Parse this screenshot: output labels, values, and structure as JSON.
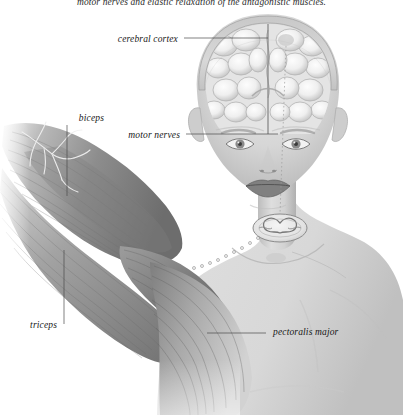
{
  "figure": {
    "caption_top": "motor nerves and elastic relaxation of the antagonistic muscles.",
    "background_color": "#ffffff",
    "skin_tone": "#d4d4d4",
    "muscle_tone": "#8f8f8f",
    "outline_color": "#6e6e6e",
    "label_color": "#171717",
    "leader_color": "#4a4a4a"
  },
  "labels": [
    {
      "id": "cerebral-cortex",
      "text": "cerebral cortex",
      "x": 178,
      "y": 41,
      "align": "right",
      "leader": {
        "x1": 184,
        "y1": 38,
        "x2": 268,
        "y2": 38
      }
    },
    {
      "id": "biceps",
      "text": "biceps",
      "x": 104,
      "y": 120,
      "align": "right",
      "leader": {
        "x1": 67,
        "y1": 125,
        "x2": 67,
        "y2": 196
      }
    },
    {
      "id": "motor-nerves",
      "text": "motor nerves",
      "x": 180,
      "y": 137,
      "align": "right",
      "leader": {
        "x1": 186,
        "y1": 134,
        "x2": 278,
        "y2": 134
      }
    },
    {
      "id": "triceps",
      "text": "triceps",
      "x": 57,
      "y": 327,
      "align": "right",
      "leader": {
        "x1": 64,
        "y1": 250,
        "x2": 64,
        "y2": 324
      }
    },
    {
      "id": "pectoralis-major",
      "text": "pectoralis major",
      "x": 273,
      "y": 334,
      "align": "left",
      "leader": {
        "x1": 207,
        "y1": 333,
        "x2": 266,
        "y2": 333
      }
    }
  ],
  "structures": [
    {
      "id": "brain",
      "name": "cerebral cortex (coronal section)"
    },
    {
      "id": "head",
      "name": "head and face, frontal view"
    },
    {
      "id": "spinal-cord",
      "name": "spinal cord cross-section"
    },
    {
      "id": "nerve-path",
      "name": "motor nerve pathway, dotted"
    },
    {
      "id": "arm",
      "name": "upper arm with biceps and triceps"
    },
    {
      "id": "pectoralis",
      "name": "pectoralis major muscle"
    },
    {
      "id": "torso",
      "name": "neck, shoulders and chest"
    }
  ]
}
